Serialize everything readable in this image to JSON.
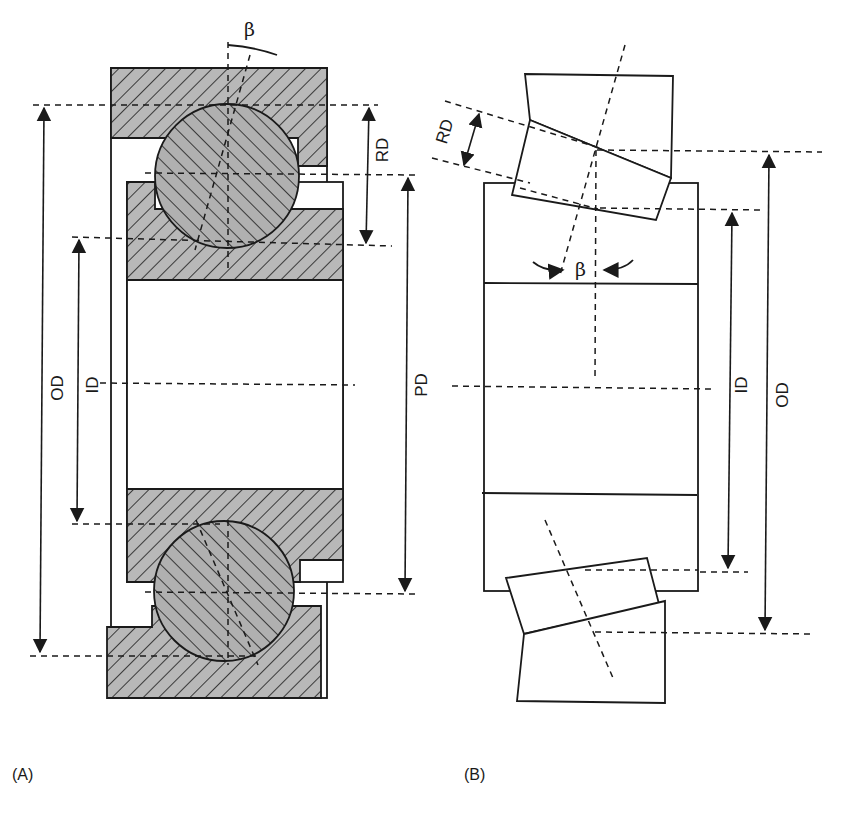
{
  "figure": {
    "panel_a": {
      "caption": "(A)",
      "type": "ball bearing cross-section (angular contact)",
      "labels": {
        "contact_angle": "β",
        "outer_diameter": "OD",
        "inner_diameter": "ID",
        "pitch_diameter": "PD",
        "rolling_element_diameter": "RD"
      }
    },
    "panel_b": {
      "caption": "(B)",
      "type": "tapered roller bearing cross-section",
      "labels": {
        "contact_angle": "β",
        "outer_diameter": "OD",
        "inner_diameter": "ID",
        "rolling_element_diameter": "RD"
      }
    },
    "colors": {
      "ink": "#1a1a1a",
      "hatch_fill": "#b5b5b5",
      "background": "#ffffff"
    }
  }
}
